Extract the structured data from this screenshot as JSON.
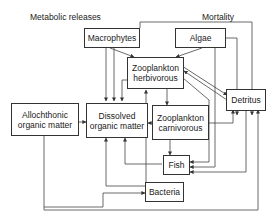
{
  "labels": {
    "metabolic": "Metabolic releases",
    "mortality": "Mortality"
  },
  "nodes": {
    "macrophytes": {
      "line1": "Macrophytes"
    },
    "algae": {
      "line1": "Algae"
    },
    "zoo_herb": {
      "line1": "Zooplankton",
      "line2": "herbivorous"
    },
    "allochthonic": {
      "line1": "Allochthonic",
      "line2": "organic matter"
    },
    "dissolved": {
      "line1": "Dissolved",
      "line2": "organic matter"
    },
    "zoo_carn": {
      "line1": "Zooplankton",
      "line2": "carnivorous"
    },
    "detritus": {
      "line1": "Detritus"
    },
    "fish": {
      "line1": "Fish"
    },
    "bacteria": {
      "line1": "Bacteria"
    }
  },
  "edges": [
    [
      "Macrophytes",
      "Zooplankton herbivorous"
    ],
    [
      "Algae",
      "Zooplankton herbivorous"
    ],
    [
      "Macrophytes",
      "Dissolved organic matter"
    ],
    [
      "Algae",
      "Dissolved organic matter"
    ],
    [
      "Zooplankton herbivorous",
      "Dissolved organic matter"
    ],
    [
      "Macrophytes",
      "Detritus"
    ],
    [
      "Algae",
      "Detritus"
    ],
    [
      "Zooplankton herbivorous",
      "Detritus"
    ],
    [
      "Detritus",
      "Zooplankton herbivorous"
    ],
    [
      "Zooplankton herbivorous",
      "Zooplankton carnivorous"
    ],
    [
      "Zooplankton carnivorous",
      "Dissolved organic matter"
    ],
    [
      "Zooplankton carnivorous",
      "Detritus"
    ],
    [
      "Zooplankton carnivorous",
      "Fish"
    ],
    [
      "Zooplankton herbivorous",
      "Fish"
    ],
    [
      "Algae",
      "Fish"
    ],
    [
      "Detritus",
      "Fish"
    ],
    [
      "Fish",
      "Dissolved organic matter"
    ],
    [
      "Allochthonic organic matter",
      "Dissolved organic matter"
    ],
    [
      "Allochthonic organic matter",
      "Bacteria"
    ],
    [
      "Bacteria",
      "Dissolved organic matter"
    ],
    [
      "Bacteria",
      "Zooplankton herbivorous"
    ],
    [
      "Bacteria",
      "Detritus"
    ]
  ]
}
